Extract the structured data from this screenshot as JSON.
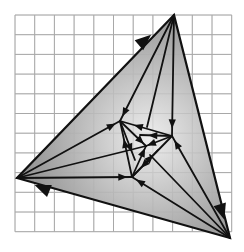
{
  "figure": {
    "width": 244,
    "height": 252,
    "background": "#ffffff",
    "grid": {
      "x0": 15,
      "y0": 15,
      "cols": 11,
      "rows": 11,
      "cell": 19.7,
      "color": "#a8a8a8",
      "width": 1
    },
    "outer_triangle": {
      "vertices": [
        [
          174,
          15
        ],
        [
          17,
          178
        ],
        [
          230,
          238
        ]
      ],
      "fill_center": "#eeeeee",
      "fill_edge": "#8e8e8e",
      "stroke": "#111111",
      "stroke_width": 2.2
    },
    "inner_triangle": {
      "vertices": [
        [
          120,
          121
        ],
        [
          172,
          136
        ],
        [
          132,
          177
        ]
      ],
      "stroke": "#111111"
    },
    "center": [
      146,
      146
    ],
    "edge_arrows": [
      {
        "at": [
          145,
          40
        ],
        "dir_to": [
          174,
          15
        ]
      },
      {
        "at": [
          42,
          188
        ],
        "dir_to": [
          17,
          178
        ]
      },
      {
        "at": [
          222,
          212
        ],
        "dir_to": [
          230,
          238
        ]
      }
    ],
    "segments": [
      {
        "from": [
          174,
          15
        ],
        "to": [
          120,
          121
        ],
        "arrow_at": 0.92
      },
      {
        "from": [
          174,
          15
        ],
        "to": [
          147,
          127
        ],
        "arrow_at": 0.0
      },
      {
        "from": [
          174,
          15
        ],
        "to": [
          172,
          136
        ],
        "arrow_at": 0.9
      },
      {
        "from": [
          17,
          178
        ],
        "to": [
          120,
          121
        ],
        "arrow_at": 0.92
      },
      {
        "from": [
          17,
          178
        ],
        "to": [
          146,
          146
        ],
        "arrow_at": 0.0
      },
      {
        "from": [
          17,
          178
        ],
        "to": [
          132,
          177
        ],
        "arrow_at": 0.92
      },
      {
        "from": [
          230,
          238
        ],
        "to": [
          172,
          136
        ],
        "arrow_at": 0.92
      },
      {
        "from": [
          230,
          238
        ],
        "to": [
          150,
          155
        ],
        "arrow_at": 0.0
      },
      {
        "from": [
          230,
          238
        ],
        "to": [
          132,
          177
        ],
        "arrow_at": 0.92
      },
      {
        "from": [
          120,
          121
        ],
        "to": [
          172,
          136
        ],
        "arrow_at": 0.35,
        "reverse": true
      },
      {
        "from": [
          172,
          136
        ],
        "to": [
          132,
          177
        ],
        "arrow_at": 0.7
      },
      {
        "from": [
          132,
          177
        ],
        "to": [
          120,
          121
        ],
        "arrow_at": 0.6
      },
      {
        "from": [
          120,
          121
        ],
        "to": [
          146,
          146
        ],
        "arrow_at": 0.8
      },
      {
        "from": [
          172,
          136
        ],
        "to": [
          146,
          146
        ],
        "arrow_at": 0.8
      },
      {
        "from": [
          132,
          177
        ],
        "to": [
          146,
          146
        ],
        "arrow_at": 0.8
      },
      {
        "from": [
          120,
          121
        ],
        "to": [
          135,
          160
        ],
        "arrow_at": 0.7
      },
      {
        "from": [
          172,
          136
        ],
        "to": [
          140,
          135
        ],
        "arrow_at": 0.6
      },
      {
        "from": [
          132,
          177
        ],
        "to": [
          158,
          150
        ],
        "arrow_at": 0.7
      }
    ]
  }
}
